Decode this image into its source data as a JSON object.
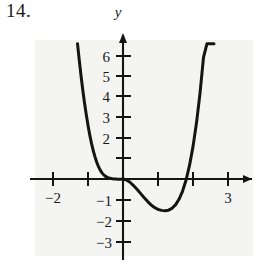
{
  "problem": {
    "number_label": "14."
  },
  "figure": {
    "y_axis_name": "y",
    "curve_color": "#141414",
    "axis_color": "#141414",
    "panel_color": "#f4f4f2",
    "background_color": "#ffffff"
  },
  "chart_data": {
    "type": "line",
    "title": "",
    "subtitle": "",
    "xlabel": "",
    "ylabel": "y",
    "grid": false,
    "legend": null,
    "xlim": [
      -2.45,
      3.35
    ],
    "ylim": [
      -3.35,
      6.7
    ],
    "x_ticks": [
      -2,
      -1,
      1,
      2,
      3
    ],
    "x_tick_labels": [
      "−2",
      "",
      "",
      "",
      "3"
    ],
    "y_ticks": [
      -3,
      -2,
      -1,
      1,
      2,
      3,
      4,
      5,
      6
    ],
    "y_tick_labels": [
      "−3",
      "−2",
      "−1",
      "",
      "2",
      "3",
      "4",
      "5",
      "6"
    ],
    "x_axis_arrow": "right",
    "y_axis_arrow": "up",
    "annotations": [],
    "series": [
      {
        "name": "curve",
        "description": "quartic-like polynomial with local minimum near (1.5, -1.5), touching zero near x=0 and rising steeply outside [-1.3, 2.2]",
        "x": [
          -1.3,
          -1.25,
          -1.2,
          -1.15,
          -1.1,
          -1.05,
          -1.0,
          -0.95,
          -0.9,
          -0.85,
          -0.8,
          -0.75,
          -0.7,
          -0.65,
          -0.6,
          -0.55,
          -0.5,
          -0.45,
          -0.4,
          -0.35,
          -0.3,
          -0.25,
          -0.2,
          -0.15,
          -0.1,
          -0.05,
          0.0,
          0.1,
          0.2,
          0.3,
          0.4,
          0.5,
          0.6,
          0.7,
          0.8,
          0.9,
          1.0,
          1.1,
          1.2,
          1.3,
          1.4,
          1.5,
          1.6,
          1.7,
          1.8,
          1.9,
          2.0,
          2.1,
          2.2,
          2.3,
          2.4,
          2.5,
          2.6
        ],
        "y": [
          6.6,
          5.8,
          5.05,
          4.35,
          3.72,
          3.15,
          2.62,
          2.15,
          1.74,
          1.38,
          1.08,
          0.82,
          0.6,
          0.43,
          0.3,
          0.2,
          0.13,
          0.08,
          0.05,
          0.03,
          0.01,
          0.0,
          0.0,
          -0.01,
          -0.01,
          -0.01,
          0.0,
          -0.05,
          -0.16,
          -0.32,
          -0.5,
          -0.7,
          -0.9,
          -1.09,
          -1.26,
          -1.39,
          -1.48,
          -1.53,
          -1.55,
          -1.52,
          -1.43,
          -1.26,
          -0.99,
          -0.6,
          -0.06,
          0.66,
          1.58,
          2.74,
          4.18,
          5.93,
          6.6,
          6.6,
          6.6
        ]
      }
    ]
  }
}
